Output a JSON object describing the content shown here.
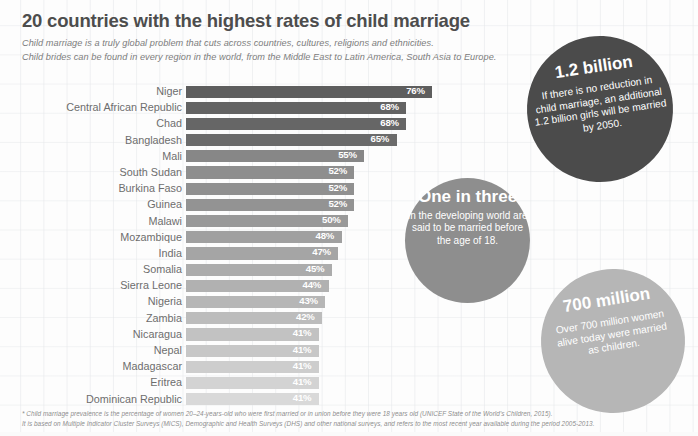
{
  "header": {
    "title": "20 countries with the highest rates of child marriage",
    "subtitle_line1": "Child marriage is a truly global problem that cuts across countries,  cultures, religions and ethnicities.",
    "subtitle_line2": "Child brides can be found in every region in the world, from the Middle East to Latin America, South Asia to Europe."
  },
  "chart_data": {
    "type": "bar",
    "title": "20 countries with the highest rates of child marriage",
    "xlabel": "",
    "ylabel": "",
    "orientation": "horizontal",
    "xlim": [
      0,
      80
    ],
    "grid": true,
    "legend": "none",
    "value_suffix": "%",
    "categories": [
      "Niger",
      "Central African Republic",
      "Chad",
      "Bangladesh",
      "Mali",
      "South Sudan",
      "Burkina Faso",
      "Guinea",
      "Malawi",
      "Mozambique",
      "India",
      "Somalia",
      "Sierra Leone",
      "Nigeria",
      "Zambia",
      "Nicaragua",
      "Nepal",
      "Madagascar",
      "Eritrea",
      "Dominican Republic"
    ],
    "values": [
      76,
      68,
      68,
      65,
      55,
      52,
      52,
      52,
      50,
      48,
      47,
      45,
      44,
      43,
      42,
      41,
      41,
      41,
      41,
      41
    ],
    "value_labels": [
      "76%",
      "68%",
      "68%",
      "65%",
      "55%",
      "52%",
      "52%",
      "52%",
      "50%",
      "48%",
      "47%",
      "45%",
      "44%",
      "43%",
      "42%",
      "41%",
      "41%",
      "41%",
      "41%",
      "41%"
    ],
    "bar_colors": [
      "#5e5e5e",
      "#636363",
      "#666666",
      "#6b6b6b",
      "#878787",
      "#8e8e8e",
      "#909090",
      "#939393",
      "#999999",
      "#a0a0a0",
      "#a5a5a5",
      "#acacac",
      "#b1b1b1",
      "#b6b6b6",
      "#bcbcbc",
      "#c2c2c2",
      "#c7c7c7",
      "#cdcdcd",
      "#d3d3d3",
      "#d9d9d9"
    ]
  },
  "circles": {
    "billion": {
      "headline": "1.2 billion",
      "body": "If there is no reduction in child marriage, an additional 1.2 billion girls will be married by 2050.",
      "color": "#4b4b4b"
    },
    "one_in_three": {
      "headline": "One in three",
      "body": "In the developing world are said to be married before the age of 18.",
      "color": "#8e8e8e"
    },
    "seven_hundred": {
      "headline": "700 million",
      "body": "Over 700 million women alive today were married as children.",
      "color": "#b6b6b6"
    }
  },
  "footnotes": {
    "line1": "* Child marriage prevalence is the percentage of women 20–24-years-old who were first married or in union before they were 18 years old (UNICEF State of the World's Children, 2015).",
    "line2": "It is based on Multiple Indicator Cluster Surveys (MICS), Demographic and Health Surveys (DHS) and other national surveys, and refers to the most recent year available during the period 2005-2013."
  }
}
